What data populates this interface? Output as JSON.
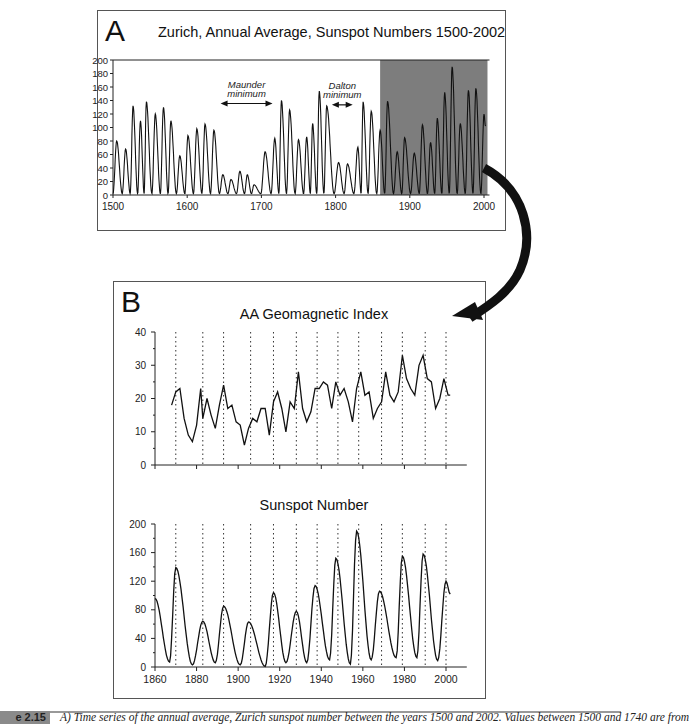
{
  "panel_a": {
    "letter": "A",
    "title": "Zurich, Annual Average, Sunspot Numbers 1500-2002",
    "annotations": {
      "maunder": [
        "Maunder",
        "minimum"
      ],
      "dalton": [
        "Dalton",
        "minimum"
      ]
    }
  },
  "panel_b": {
    "letter": "B",
    "top_title": "AA Geomagnetic Index",
    "bottom_title": "Sunspot Number"
  },
  "caption": {
    "label": "e 2.15",
    "text": "A) Time series of the annual average, Zurich sunspot number between the years 1500 and 2002. Values between 1500 and 1740 are from"
  },
  "colors": {
    "shade": "#7d7d7d",
    "line": "#111111",
    "frame": "#555555",
    "arrow": "#111111"
  },
  "chart_data": [
    {
      "id": "A",
      "type": "line",
      "title": "Zurich, Annual Average, Sunspot Numbers 1500-2002",
      "xlabel": "",
      "ylabel": "",
      "xlim": [
        1500,
        2002
      ],
      "ylim": [
        0,
        200
      ],
      "xticks": [
        1500,
        1600,
        1700,
        1800,
        1900,
        2000
      ],
      "yticks": [
        0,
        20,
        40,
        60,
        80,
        100,
        120,
        140,
        160,
        180,
        200
      ],
      "grid": false,
      "shaded_region": {
        "x_start": 1860,
        "x_end": 2002,
        "color": "#7d7d7d"
      },
      "annotations": [
        {
          "text": "Maunder minimum",
          "arrow_from": 1645,
          "arrow_to": 1715,
          "y": 140
        },
        {
          "text": "Dalton minimum",
          "arrow_from": 1795,
          "arrow_to": 1823,
          "y": 138
        }
      ],
      "cycle_peaks": [
        {
          "year": 1505,
          "value": 80
        },
        {
          "year": 1517,
          "value": 68
        },
        {
          "year": 1527,
          "value": 132
        },
        {
          "year": 1537,
          "value": 110
        },
        {
          "year": 1545,
          "value": 138
        },
        {
          "year": 1557,
          "value": 120
        },
        {
          "year": 1568,
          "value": 130
        },
        {
          "year": 1578,
          "value": 110
        },
        {
          "year": 1590,
          "value": 58
        },
        {
          "year": 1601,
          "value": 88
        },
        {
          "year": 1613,
          "value": 98
        },
        {
          "year": 1624,
          "value": 105
        },
        {
          "year": 1636,
          "value": 96
        },
        {
          "year": 1648,
          "value": 30
        },
        {
          "year": 1659,
          "value": 23
        },
        {
          "year": 1671,
          "value": 35
        },
        {
          "year": 1681,
          "value": 30
        },
        {
          "year": 1690,
          "value": 15
        },
        {
          "year": 1705,
          "value": 64
        },
        {
          "year": 1718,
          "value": 84
        },
        {
          "year": 1727,
          "value": 140
        },
        {
          "year": 1738,
          "value": 126
        },
        {
          "year": 1750,
          "value": 82
        },
        {
          "year": 1761,
          "value": 86
        },
        {
          "year": 1769,
          "value": 106
        },
        {
          "year": 1778,
          "value": 154
        },
        {
          "year": 1788,
          "value": 132
        },
        {
          "year": 1804,
          "value": 48
        },
        {
          "year": 1816,
          "value": 46
        },
        {
          "year": 1830,
          "value": 71
        },
        {
          "year": 1837,
          "value": 138
        },
        {
          "year": 1848,
          "value": 124
        },
        {
          "year": 1860,
          "value": 96
        },
        {
          "year": 1870,
          "value": 139
        },
        {
          "year": 1883,
          "value": 64
        },
        {
          "year": 1893,
          "value": 85
        },
        {
          "year": 1906,
          "value": 62
        },
        {
          "year": 1917,
          "value": 104
        },
        {
          "year": 1928,
          "value": 78
        },
        {
          "year": 1937,
          "value": 114
        },
        {
          "year": 1947,
          "value": 152
        },
        {
          "year": 1957,
          "value": 190
        },
        {
          "year": 1968,
          "value": 106
        },
        {
          "year": 1979,
          "value": 155
        },
        {
          "year": 1989,
          "value": 158
        },
        {
          "year": 2000,
          "value": 120
        }
      ]
    },
    {
      "id": "B-top",
      "type": "line",
      "title": "AA Geomagnetic Index",
      "xlim": [
        1860,
        2010
      ],
      "ylim": [
        0,
        40
      ],
      "yticks": [
        0,
        10,
        20,
        30,
        40
      ],
      "xticks": [
        1860,
        1880,
        1900,
        1920,
        1940,
        1960,
        1980,
        2000
      ],
      "tick_labels_visible_x": false,
      "grid": false,
      "vertical_dotted_lines": [
        1870,
        1883,
        1893,
        1906,
        1917,
        1928,
        1938,
        1948,
        1958,
        1969,
        1979,
        1990,
        2000
      ],
      "x": [
        1868,
        1870,
        1872,
        1874,
        1876,
        1878,
        1880,
        1882,
        1883,
        1885,
        1887,
        1889,
        1891,
        1893,
        1895,
        1897,
        1899,
        1901,
        1903,
        1905,
        1907,
        1909,
        1911,
        1913,
        1915,
        1917,
        1919,
        1921,
        1923,
        1925,
        1927,
        1929,
        1931,
        1933,
        1935,
        1937,
        1939,
        1941,
        1943,
        1945,
        1947,
        1949,
        1951,
        1953,
        1955,
        1957,
        1959,
        1961,
        1963,
        1965,
        1967,
        1969,
        1971,
        1973,
        1975,
        1977,
        1979,
        1981,
        1983,
        1985,
        1987,
        1989,
        1991,
        1993,
        1995,
        1997,
        1999,
        2001,
        2002
      ],
      "values": [
        18,
        22,
        23,
        14,
        9,
        7,
        12,
        23,
        14,
        20,
        15,
        11,
        18,
        24,
        17,
        18,
        13,
        12,
        6,
        11,
        14,
        13,
        17,
        17,
        9,
        19,
        22,
        17,
        10,
        19,
        17,
        28,
        17,
        13,
        16,
        23,
        23,
        25,
        24,
        17,
        25,
        21,
        23,
        19,
        13,
        23,
        28,
        21,
        22,
        14,
        17,
        19,
        28,
        21,
        19,
        22,
        33,
        26,
        23,
        21,
        30,
        33,
        26,
        25,
        17,
        20,
        26,
        21,
        21
      ]
    },
    {
      "id": "B-bottom",
      "type": "line",
      "title": "Sunspot Number",
      "xlim": [
        1860,
        2010
      ],
      "ylim": [
        0,
        200
      ],
      "yticks": [
        0,
        40,
        80,
        120,
        160,
        200
      ],
      "xticks": [
        1860,
        1880,
        1900,
        1920,
        1940,
        1960,
        1980,
        2000
      ],
      "grid": false,
      "vertical_dotted_lines": [
        1870,
        1883,
        1893,
        1906,
        1917,
        1928,
        1938,
        1948,
        1958,
        1969,
        1979,
        1990,
        2000
      ],
      "cycle_peaks": [
        {
          "year": 1860,
          "value": 96
        },
        {
          "year": 1870,
          "value": 139
        },
        {
          "year": 1883,
          "value": 64
        },
        {
          "year": 1893,
          "value": 85
        },
        {
          "year": 1905,
          "value": 63
        },
        {
          "year": 1917,
          "value": 104
        },
        {
          "year": 1928,
          "value": 78
        },
        {
          "year": 1937,
          "value": 114
        },
        {
          "year": 1947,
          "value": 152
        },
        {
          "year": 1957,
          "value": 190
        },
        {
          "year": 1968,
          "value": 106
        },
        {
          "year": 1979,
          "value": 155
        },
        {
          "year": 1989,
          "value": 158
        },
        {
          "year": 2000,
          "value": 120
        }
      ],
      "cycle_minima": [
        {
          "year": 1867,
          "value": 7
        },
        {
          "year": 1878,
          "value": 3
        },
        {
          "year": 1889,
          "value": 6
        },
        {
          "year": 1901,
          "value": 3
        },
        {
          "year": 1913,
          "value": 1
        },
        {
          "year": 1923,
          "value": 6
        },
        {
          "year": 1933,
          "value": 6
        },
        {
          "year": 1944,
          "value": 10
        },
        {
          "year": 1954,
          "value": 4
        },
        {
          "year": 1964,
          "value": 10
        },
        {
          "year": 1976,
          "value": 13
        },
        {
          "year": 1986,
          "value": 13
        },
        {
          "year": 1996,
          "value": 9
        }
      ]
    }
  ]
}
